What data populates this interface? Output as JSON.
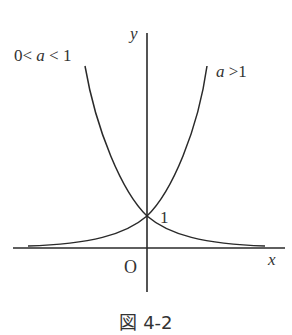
{
  "diagram": {
    "axes": {
      "x_label": "x",
      "y_label": "y",
      "origin_label": "O",
      "intercept_label": "1"
    },
    "curves": [
      {
        "name": "decreasing",
        "label_prefix": "0< ",
        "label_var": "a",
        "label_suffix": " < 1",
        "condition": "0 < a < 1"
      },
      {
        "name": "increasing",
        "label_var": "a",
        "label_suffix": " >1",
        "condition": "a > 1"
      }
    ],
    "caption": "図 4-2",
    "colors": {
      "line": "#2a2a2a",
      "background": "#ffffff"
    }
  }
}
